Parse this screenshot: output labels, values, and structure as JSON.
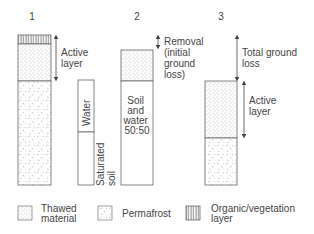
{
  "columns": [
    {
      "number": "1",
      "annotations": [
        {
          "label_lines": [
            "Active",
            "layer"
          ]
        }
      ]
    },
    {
      "number": "2",
      "annotations": [
        {
          "label_lines": [
            "Removal",
            "(initial",
            "ground",
            "loss)"
          ]
        }
      ],
      "inner_label_lines": [
        "Soil",
        "and",
        "water",
        "50:50"
      ]
    },
    {
      "number": "3",
      "annotations": [
        {
          "label_lines": [
            "Total ground",
            "loss"
          ]
        },
        {
          "label_lines": [
            "Active",
            "layer"
          ]
        }
      ]
    }
  ],
  "water_column": {
    "top_label": "Water",
    "bottom_label_lines": [
      "Saturated",
      "soil"
    ]
  },
  "legend": [
    {
      "pattern": "thawed",
      "label_lines": [
        "Thawed",
        "material"
      ]
    },
    {
      "pattern": "permafrost",
      "label_lines": [
        "Permafrost"
      ]
    },
    {
      "pattern": "organic",
      "label_lines": [
        "Organic/vegetation",
        "layer"
      ]
    }
  ]
}
